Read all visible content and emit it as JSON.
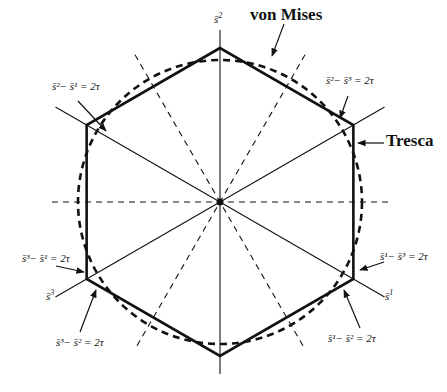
{
  "figure": {
    "width": 447,
    "height": 392,
    "center": [
      220,
      202
    ],
    "hexagon_radius": 154,
    "circle_radius": 142,
    "colors": {
      "ink": "#111111",
      "background": "#ffffff"
    }
  },
  "axes": [
    {
      "name": "s2-axis",
      "angle_deg": 90,
      "length_pos": 172,
      "length_neg": 172,
      "style": "solid"
    },
    {
      "name": "s1-axis",
      "angle_deg": -30,
      "length_pos": 190,
      "length_neg": 190,
      "style": "solid"
    },
    {
      "name": "s3-axis",
      "angle_deg": 210,
      "length_pos": 190,
      "length_neg": 190,
      "style": "solid"
    }
  ],
  "dashed_lines": [
    {
      "name": "horizontal-dashed",
      "angle_deg": 0,
      "half_length": 168
    },
    {
      "name": "dashed-60",
      "angle_deg": 60,
      "half_length": 170
    },
    {
      "name": "dashed-120",
      "angle_deg": 120,
      "half_length": 170
    }
  ],
  "labels": {
    "axis_s2": {
      "base": "s̄",
      "sup": "2",
      "x": 214,
      "y": 23
    },
    "axis_s1": {
      "base": "s̄",
      "sup": "1",
      "x": 385,
      "y": 300
    },
    "axis_s3": {
      "base": "s̄",
      "sup": "3",
      "x": 46,
      "y": 300
    },
    "von_mises": {
      "text": "von Mises",
      "x": 250,
      "y": 20
    },
    "tresca": {
      "text": "Tresca",
      "x": 386,
      "y": 146
    }
  },
  "equations": [
    {
      "name": "eq-s2-minus-s1",
      "text": "s̄²− s̄¹ = 2τ",
      "x": 52,
      "y": 90,
      "arrow_from": [
        78,
        101
      ],
      "arrow_to": [
        106,
        131
      ]
    },
    {
      "name": "eq-s2-minus-s3",
      "text": "s̄²− s̄³ = 2τ",
      "x": 326,
      "y": 84,
      "arrow_from": [
        348,
        96
      ],
      "arrow_to": [
        340,
        118
      ]
    },
    {
      "name": "eq-s1-minus-s3",
      "text": "s̄¹− s̄³ = 2τ",
      "x": 380,
      "y": 260,
      "arrow_from": [
        384,
        262
      ],
      "arrow_to": [
        360,
        270
      ]
    },
    {
      "name": "eq-s3-minus-s1",
      "text": "s̄³− s̄¹ = 2τ",
      "x": 22,
      "y": 262,
      "arrow_from": [
        56,
        266
      ],
      "arrow_to": [
        84,
        272
      ]
    },
    {
      "name": "eq-s3-minus-s2",
      "text": "s̄³− s̄² = 2τ",
      "x": 56,
      "y": 346,
      "arrow_from": [
        80,
        332
      ],
      "arrow_to": [
        96,
        290
      ]
    },
    {
      "name": "eq-s1-minus-s2",
      "text": "s̄¹− s̄² = 2τ",
      "x": 328,
      "y": 342,
      "arrow_from": [
        360,
        328
      ],
      "arrow_to": [
        344,
        290
      ]
    }
  ],
  "tresca_arrow": {
    "from": [
      384,
      143
    ],
    "to": [
      358,
      143
    ]
  },
  "von_mises_arrow": {
    "from": [
      284,
      24
    ],
    "to": [
      272,
      56
    ]
  }
}
